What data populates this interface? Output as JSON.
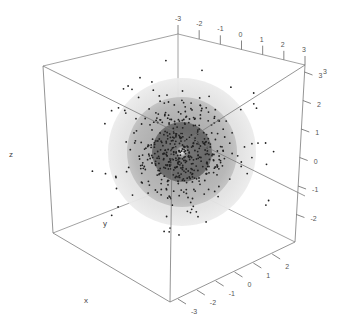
{
  "chart_data": {
    "type": "scatter",
    "title": "",
    "subtitle": "",
    "xlabel": "x",
    "ylabel": "y",
    "zlabel": "z",
    "xlim": [
      -3,
      3
    ],
    "ylim": [
      -3,
      3
    ],
    "zlim": [
      -3,
      3
    ],
    "grid": false,
    "legend": null,
    "x_ticks": [
      "-3",
      "-2",
      "-1",
      "0",
      "1",
      "2",
      "3"
    ],
    "y_ticks": [
      "-3",
      "-2",
      "-1",
      "0",
      "1",
      "2",
      "3"
    ],
    "z_ticks": [
      "-2",
      "-1",
      "0",
      "1",
      "2",
      "3"
    ],
    "spheres": [
      {
        "name": "outer",
        "radius_units": 3.0,
        "color": "#e4e4e4"
      },
      {
        "name": "middle",
        "radius_units": 2.2,
        "color": "#b4b4b4"
      },
      {
        "name": "inner",
        "radius_units": 1.2,
        "color": "#6a6a6a"
      },
      {
        "name": "core",
        "radius_units": 0.2,
        "color": "#d8d8d8"
      }
    ],
    "point_count_approx": 500,
    "point_color": "#222222"
  },
  "labels": {
    "x_axis": "x",
    "y_axis": "y",
    "z_axis": "z"
  }
}
